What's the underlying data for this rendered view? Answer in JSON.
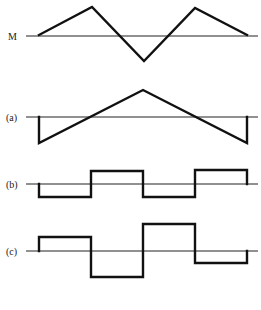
{
  "figure": {
    "panels": [
      {
        "id": "M",
        "label": "M",
        "axis_y": 36,
        "axis_x": [
          26,
          258
        ],
        "points": [
          [
            39,
            35
          ],
          [
            92,
            7
          ],
          [
            144,
            61
          ],
          [
            195,
            8
          ],
          [
            247,
            35
          ]
        ]
      },
      {
        "id": "a",
        "label": "(a)",
        "axis_y": 117,
        "axis_x": [
          26,
          258
        ],
        "points": [
          [
            39,
            117
          ],
          [
            39,
            143
          ],
          [
            143,
            90
          ],
          [
            247,
            143
          ],
          [
            247,
            117
          ]
        ]
      },
      {
        "id": "b",
        "label": "(b)",
        "axis_y": 184,
        "axis_x": [
          26,
          258
        ],
        "points": [
          [
            39,
            184
          ],
          [
            39,
            197
          ],
          [
            91,
            197
          ],
          [
            91,
            171
          ],
          [
            143,
            171
          ],
          [
            143,
            197
          ],
          [
            195,
            197
          ],
          [
            195,
            170
          ],
          [
            247,
            170
          ],
          [
            247,
            184
          ]
        ]
      },
      {
        "id": "c",
        "label": "(c)",
        "axis_y": 251,
        "axis_x": [
          26,
          258
        ],
        "points": [
          [
            39,
            251
          ],
          [
            39,
            237
          ],
          [
            91,
            237
          ],
          [
            91,
            277
          ],
          [
            143,
            277
          ],
          [
            143,
            224
          ],
          [
            195,
            224
          ],
          [
            195,
            263
          ],
          [
            247,
            263
          ],
          [
            247,
            251
          ]
        ]
      }
    ],
    "caption": ""
  },
  "chart_data": {
    "type": "line",
    "title": "",
    "series": [
      {
        "name": "M",
        "x": [
          0,
          1,
          2,
          3,
          4
        ],
        "values": [
          0,
          1,
          -1,
          1,
          0
        ]
      },
      {
        "name": "(a)",
        "x": [
          0,
          0,
          2,
          4,
          4
        ],
        "values": [
          0,
          -1,
          1,
          -1,
          0
        ]
      },
      {
        "name": "(b)",
        "x": [
          0,
          0,
          1,
          1,
          2,
          2,
          3,
          3,
          4,
          4
        ],
        "values": [
          0,
          -1,
          -1,
          1,
          1,
          -1,
          -1,
          1,
          1,
          0
        ]
      },
      {
        "name": "(c)",
        "x": [
          0,
          0,
          1,
          1,
          2,
          2,
          3,
          3,
          4,
          4
        ],
        "values": [
          0,
          1,
          1,
          -2,
          -2,
          2,
          2,
          -1,
          -1,
          0
        ]
      }
    ],
    "xlabel": "",
    "ylabel": "",
    "grid": false
  }
}
